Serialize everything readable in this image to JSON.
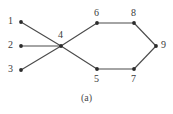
{
  "figure": {
    "caption": "(a)",
    "background_color": "#ffffff",
    "edge_color": "#4a4a4a",
    "node_color": "#2b2b2b",
    "label_color": "#3a3a3a"
  },
  "graph": {
    "nodes": [
      {
        "id": "1",
        "label": "1",
        "x": 21,
        "y": 22,
        "label_x": 8,
        "label_y": 16
      },
      {
        "id": "2",
        "label": "2",
        "x": 21,
        "y": 46,
        "label_x": 8,
        "label_y": 40
      },
      {
        "id": "3",
        "label": "3",
        "x": 21,
        "y": 70,
        "label_x": 8,
        "label_y": 64
      },
      {
        "id": "4",
        "label": "4",
        "x": 61,
        "y": 46,
        "label_x": 58,
        "label_y": 30
      },
      {
        "id": "5",
        "label": "5",
        "x": 97,
        "y": 69,
        "label_x": 94,
        "label_y": 74
      },
      {
        "id": "6",
        "label": "6",
        "x": 97,
        "y": 23,
        "label_x": 94,
        "label_y": 8
      },
      {
        "id": "7",
        "label": "7",
        "x": 134,
        "y": 69,
        "label_x": 131,
        "label_y": 74
      },
      {
        "id": "8",
        "label": "8",
        "x": 134,
        "y": 23,
        "label_x": 131,
        "label_y": 8
      },
      {
        "id": "9",
        "label": "9",
        "x": 156,
        "y": 46,
        "label_x": 161,
        "label_y": 40
      }
    ],
    "edges": [
      {
        "from": "1",
        "to": "4"
      },
      {
        "from": "2",
        "to": "4"
      },
      {
        "from": "3",
        "to": "4"
      },
      {
        "from": "4",
        "to": "6"
      },
      {
        "from": "4",
        "to": "5"
      },
      {
        "from": "6",
        "to": "8"
      },
      {
        "from": "5",
        "to": "7"
      },
      {
        "from": "8",
        "to": "9"
      },
      {
        "from": "7",
        "to": "9"
      }
    ]
  }
}
